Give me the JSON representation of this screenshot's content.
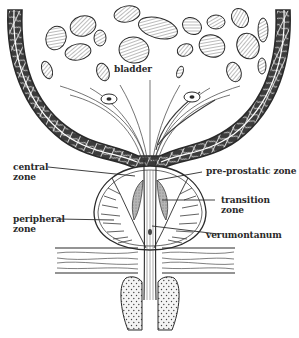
{
  "diagram": {
    "type": "anatomical-illustration",
    "colors": {
      "ink": "#2a2a2a",
      "muscle_fill": "#5a5a5a",
      "cell_fill": "#bdbdbd",
      "transition_fill": "#9a9a9a",
      "background": "#ffffff"
    },
    "labels": {
      "bladder": "bladder",
      "central_zone_line1": "central",
      "central_zone_line2": "zone",
      "peripheral_zone_line1": "peripheral",
      "peripheral_zone_line2": "zone",
      "pre_prostatic_zone": "pre-prostatic zone",
      "transition_zone_line1": "transition",
      "transition_zone_line2": "zone",
      "verumontanum": "verumontanum"
    }
  }
}
